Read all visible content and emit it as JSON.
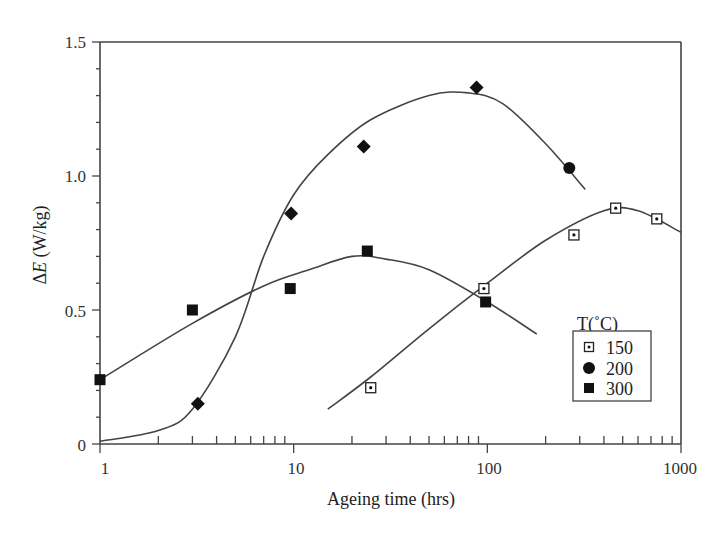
{
  "chart_data": {
    "type": "scatter",
    "title": "",
    "xlabel": "Ageing time (hrs)",
    "ylabel": "ΔE (W/kg)",
    "xscale": "log",
    "xlim": [
      1,
      1000
    ],
    "ylim": [
      0,
      1.5
    ],
    "xticks": [
      "1",
      "10",
      "100",
      "1000"
    ],
    "yticks": [
      "0",
      "0.5",
      "1.0",
      "1.5"
    ],
    "grid": false,
    "legend": {
      "title": "T(°C)",
      "position": "lower right",
      "entries": [
        "150",
        "200",
        "300"
      ]
    },
    "series": [
      {
        "name": "150",
        "marker": "dotted-open-square",
        "x": [
          25,
          96,
          280,
          460,
          750
        ],
        "y": [
          0.21,
          0.58,
          0.78,
          0.88,
          0.84
        ],
        "fit_curve": {
          "x": [
            15,
            25,
            50,
            100,
            200,
            400,
            600,
            1000
          ],
          "y": [
            0.13,
            0.25,
            0.43,
            0.6,
            0.76,
            0.87,
            0.87,
            0.79
          ]
        }
      },
      {
        "name": "200",
        "marker": "filled-circle (diamonds shown for earlier times)",
        "x": [
          3.2,
          9.7,
          23,
          88,
          265
        ],
        "y": [
          0.15,
          0.86,
          1.11,
          1.33,
          1.03
        ],
        "fit_curve": {
          "x": [
            1,
            2,
            3,
            5,
            7,
            10,
            15,
            25,
            50,
            80,
            120,
            200,
            320
          ],
          "y": [
            0.01,
            0.05,
            0.13,
            0.4,
            0.7,
            0.93,
            1.08,
            1.21,
            1.3,
            1.31,
            1.27,
            1.12,
            0.95
          ]
        }
      },
      {
        "name": "300",
        "marker": "filled-square",
        "x": [
          1,
          3,
          9.6,
          24,
          98
        ],
        "y": [
          0.24,
          0.5,
          0.58,
          0.72,
          0.53
        ],
        "fit_curve": {
          "x": [
            1,
            3,
            7,
            12,
            20,
            30,
            50,
            100,
            180
          ],
          "y": [
            0.24,
            0.45,
            0.59,
            0.65,
            0.7,
            0.69,
            0.65,
            0.53,
            0.41
          ]
        }
      }
    ]
  },
  "labels": {
    "x_axis_title": "Ageing time (hrs)",
    "y_axis_delta": "Δ",
    "y_axis_var": "E",
    "y_axis_unit": " (W/kg)",
    "legend_title": "T(˚C)",
    "legend_150": "150",
    "legend_200": "200",
    "legend_300": "300",
    "xtick_1": "1",
    "xtick_10": "10",
    "xtick_100": "100",
    "xtick_1000": "1000",
    "ytick_0": "0",
    "ytick_05": "0.5",
    "ytick_10": "1.0",
    "ytick_15": "1.5"
  }
}
